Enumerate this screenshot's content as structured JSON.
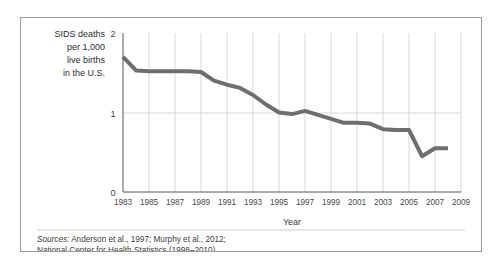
{
  "figure": {
    "border_color": "#9a9a9a",
    "background": "#ffffff"
  },
  "y_axis_label": {
    "line1": "SIDS deaths",
    "line2": "per 1,000",
    "line3": "live births",
    "line4": "in the U.S."
  },
  "sources": {
    "label": "Sources:",
    "line1_rest": " Anderson et al., 1997; Murphy et al., 2012;",
    "line2": "National Center for Health Statistics (1998–2010)."
  },
  "chart_data": {
    "type": "line",
    "title": "",
    "xlabel": "Year",
    "ylabel": "SIDS deaths per 1,000 live births in the U.S.",
    "xlim": [
      1983,
      2009
    ],
    "ylim": [
      0,
      2
    ],
    "y_ticks": [
      "0",
      "1",
      "2"
    ],
    "y_tick_values": [
      0,
      1,
      2
    ],
    "x_ticks": [
      "1983",
      "1985",
      "1987",
      "1989",
      "1991",
      "1993",
      "1995",
      "1997",
      "1999",
      "2001",
      "2003",
      "2005",
      "2007",
      "2009"
    ],
    "x_tick_values": [
      1983,
      1985,
      1987,
      1989,
      1991,
      1993,
      1995,
      1997,
      1999,
      2001,
      2003,
      2005,
      2007,
      2009
    ],
    "grid": "vertical-and-horizontal-at-1",
    "legend": "none",
    "line_color": "#6e6e6e",
    "line_width": 4,
    "x": [
      1983,
      1984,
      1985,
      1986,
      1987,
      1988,
      1989,
      1990,
      1991,
      1992,
      1993,
      1994,
      1995,
      1996,
      1997,
      1998,
      1999,
      2000,
      2001,
      2002,
      2003,
      2004,
      2005,
      2006,
      2007,
      2008
    ],
    "values": [
      1.7,
      1.53,
      1.52,
      1.52,
      1.52,
      1.52,
      1.51,
      1.4,
      1.35,
      1.31,
      1.22,
      1.1,
      1.0,
      0.98,
      1.02,
      0.97,
      0.92,
      0.87,
      0.87,
      0.86,
      0.79,
      0.78,
      0.78,
      0.45,
      0.55,
      0.55
    ]
  }
}
